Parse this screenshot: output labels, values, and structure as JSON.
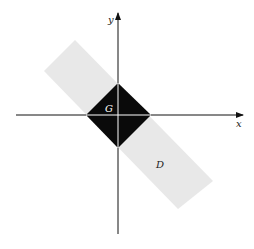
{
  "diagram": {
    "labels": {
      "x_axis": "x",
      "y_axis": "y",
      "region_g": "G",
      "region_d": "D"
    },
    "colors": {
      "background": "#ffffff",
      "band_d": "#e8e8e8",
      "square_g": "#0a0a0a",
      "axes": "#111111",
      "axes_inside_g": "#ffffff",
      "label_g": "#ffffff",
      "label_d": "#222222"
    }
  }
}
